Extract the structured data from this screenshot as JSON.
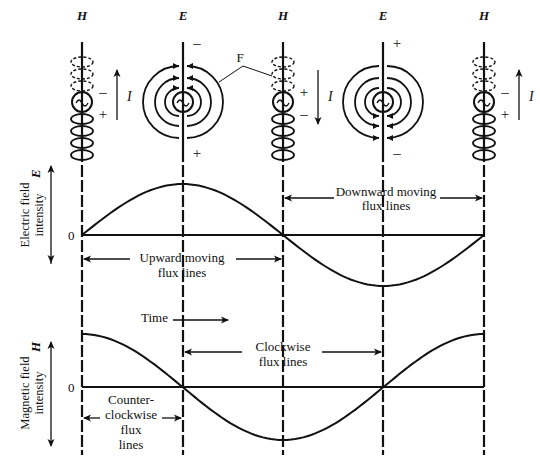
{
  "figure": {
    "type": "antenna-field-diagram",
    "top_labels": [
      "H",
      "E",
      "H",
      "E",
      "H"
    ],
    "antennas": [
      {
        "field": "H",
        "polarity_top": "-",
        "polarity_bottom": "+",
        "current_direction": "up",
        "current_label": "I"
      },
      {
        "field": "E",
        "polarity_top": "-",
        "polarity_bottom": "+",
        "flux_direction": "upward"
      },
      {
        "field": "H",
        "polarity_top": "+",
        "polarity_bottom": "-",
        "current_direction": "down",
        "current_label": "I"
      },
      {
        "field": "E",
        "polarity_top": "+",
        "polarity_bottom": "-",
        "flux_direction": "downward"
      },
      {
        "field": "H",
        "polarity_top": "-",
        "polarity_bottom": "+",
        "current_direction": "up",
        "current_label": "I"
      }
    ],
    "field_label": "F"
  },
  "chart_data": [
    {
      "type": "line",
      "title": "",
      "ylabel": "Electric field intensity",
      "ylabel_symbol": "E",
      "zero_label": "0",
      "x": [
        0,
        0.25,
        0.5,
        0.75,
        1.0
      ],
      "x_units": "cycle",
      "series": [
        {
          "name": "E",
          "function": "sine",
          "values": [
            0,
            1,
            0,
            -1,
            0
          ]
        }
      ],
      "ylim": [
        -1,
        1
      ],
      "annotations": [
        {
          "text": "Upward moving flux lines",
          "span": [
            0,
            0.5
          ]
        },
        {
          "text": "Downward moving flux lines",
          "span": [
            0.5,
            1.0
          ]
        }
      ]
    },
    {
      "type": "line",
      "title": "",
      "ylabel": "Magnetic field intensity",
      "ylabel_symbol": "H",
      "zero_label": "0",
      "x": [
        0,
        0.25,
        0.5,
        0.75,
        1.0
      ],
      "x_units": "cycle",
      "series": [
        {
          "name": "H",
          "function": "cosine",
          "values": [
            1,
            0,
            -1,
            0,
            1
          ]
        }
      ],
      "ylim": [
        -1,
        1
      ],
      "annotations": [
        {
          "text": "Time",
          "arrow": "right"
        },
        {
          "text": "Clockwise flux lines",
          "span": [
            0.25,
            0.75
          ]
        },
        {
          "text": "Counter-clockwise flux lines",
          "span": [
            0,
            0.25
          ]
        }
      ]
    }
  ],
  "labels": {
    "e_axis_line1": "Electric field",
    "e_axis_line2": "intensity",
    "h_axis_line1": "Magnetic field",
    "h_axis_line2": "intensity",
    "upward_1": "Upward moving",
    "upward_2": "flux lines",
    "downward_1": "Downward moving",
    "downward_2": "flux lines",
    "time": "Time",
    "clockwise_1": "Clockwise",
    "clockwise_2": "flux lines",
    "ccw_1": "Counter-",
    "ccw_2": "clockwise",
    "ccw_3": "flux",
    "ccw_4": "lines"
  },
  "colors": {
    "ink": "#111111",
    "background": "#ffffff"
  }
}
